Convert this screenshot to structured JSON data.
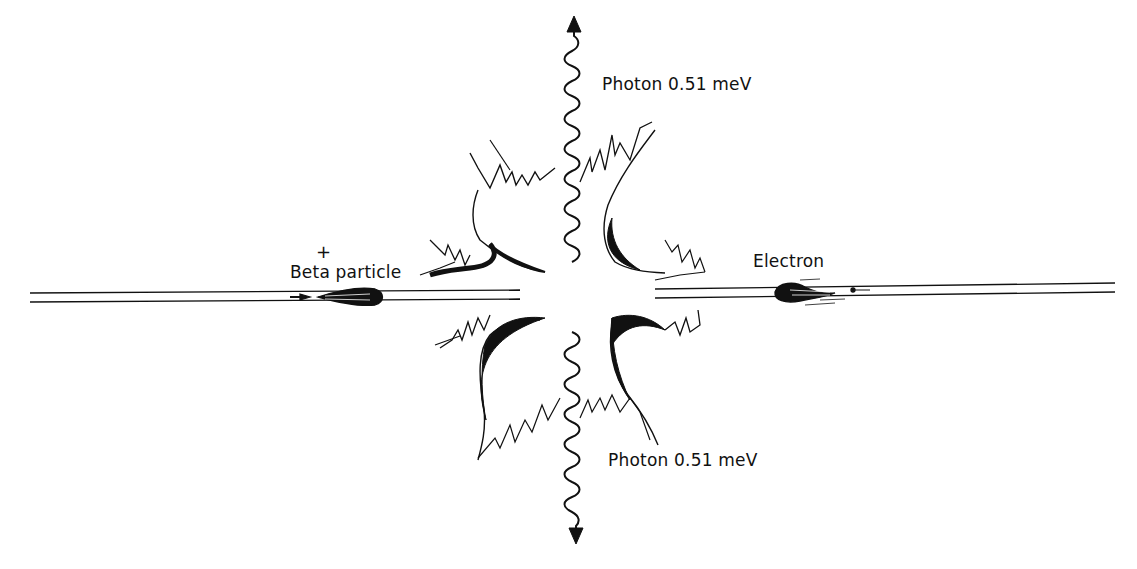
{
  "diagram": {
    "title": "",
    "labels": {
      "photon_top": "Photon 0.51 meV",
      "photon_bottom": "Photon 0.51 meV",
      "beta_charge": "+",
      "beta_particle": "Beta particle",
      "electron": "Electron"
    },
    "nodes": [
      {
        "id": "beta",
        "label": "Beta particle",
        "charge": "+",
        "position": "left"
      },
      {
        "id": "electron",
        "label": "Electron",
        "position": "right"
      },
      {
        "id": "annihilation",
        "label": "",
        "position": "center"
      },
      {
        "id": "photon-up",
        "label": "Photon 0.51 meV",
        "position": "top"
      },
      {
        "id": "photon-down",
        "label": "Photon 0.51 meV",
        "position": "bottom"
      }
    ],
    "edges": [
      {
        "from": "beta",
        "to": "annihilation",
        "style": "track-arrow"
      },
      {
        "from": "electron",
        "to": "annihilation",
        "style": "track-arrow"
      },
      {
        "from": "annihilation",
        "to": "photon-up",
        "style": "wavy-arrow"
      },
      {
        "from": "annihilation",
        "to": "photon-down",
        "style": "wavy-arrow"
      }
    ],
    "colors": {
      "ink": "#111111",
      "background": "#ffffff"
    }
  }
}
